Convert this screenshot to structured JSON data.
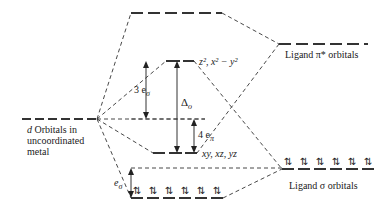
{
  "labels": {
    "d_orbitals": {
      "prefix": "d",
      "line1": " Orbitals in",
      "line2": "uncoordinated",
      "line3": "metal"
    },
    "eg_set": "z², x² − y²",
    "t2g_set": "xy, xz, yz",
    "ligand_pi_star": "Ligand π* orbitals",
    "ligand_sigma": "Ligand σ orbitals",
    "three_e_sigma": "3 e",
    "three_e_sigma_sub": "σ",
    "delta_o": "Δ",
    "delta_o_sub": "o",
    "four_e_pi": "4 e",
    "four_e_pi_sub": "π",
    "e_sigma": "e",
    "e_sigma_sub": "σ"
  },
  "electron_pairs": {
    "symbol": "⇅",
    "ligand_sigma_count": 6,
    "bonding_count": 6
  },
  "colors": {
    "line": "#333333",
    "text": "#1a1a1a"
  }
}
